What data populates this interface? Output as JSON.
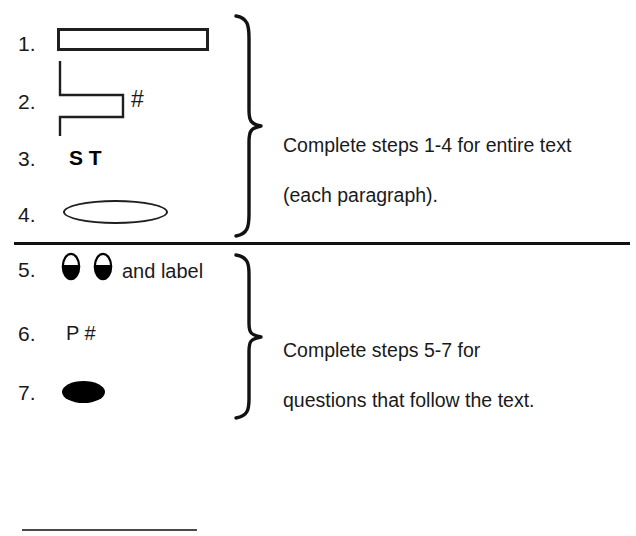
{
  "diagram": {
    "line_color": "#1f1f1f",
    "fill_color": "#000000",
    "text_color": "#1a1a1a",
    "background": "#ffffff"
  },
  "groups": [
    {
      "id": "group-upper",
      "note": "Complete steps 1-4 for entire text\n(each paragraph).",
      "note_line1": "Complete steps 1-4 for entire text",
      "note_line2": "(each paragraph)."
    },
    {
      "id": "group-lower",
      "note": "Complete steps 5-7 for\nquestions that follow the text.",
      "note_line1": "Complete steps 5-7 for",
      "note_line2": "questions that follow the text."
    }
  ],
  "steps": [
    {
      "number": "1.",
      "shape": "hollow-rectangle",
      "label": "",
      "group": "group-upper"
    },
    {
      "number": "2.",
      "shape": "zigzag-bracket",
      "label": "#",
      "group": "group-upper"
    },
    {
      "number": "3.",
      "shape": "bold-letters",
      "label": "S T",
      "group": "group-upper"
    },
    {
      "number": "4.",
      "shape": "hollow-ellipse",
      "label": "",
      "group": "group-upper"
    },
    {
      "number": "5.",
      "shape": "two-half-shaded-ovals",
      "label": "and label",
      "group": "group-lower"
    },
    {
      "number": "6.",
      "shape": "letters",
      "label": "P #",
      "group": "group-lower"
    },
    {
      "number": "7.",
      "shape": "filled-ellipse",
      "label": "",
      "group": "group-lower"
    }
  ]
}
